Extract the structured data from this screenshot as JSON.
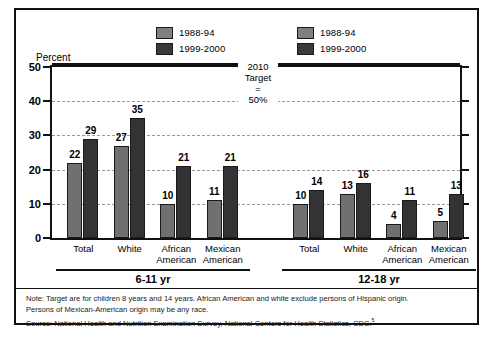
{
  "axis": {
    "ylabel": "Percent",
    "yticks": [
      "0",
      "10",
      "20",
      "30",
      "40",
      "50"
    ]
  },
  "target": {
    "line1": "2010",
    "line2": "Target =",
    "line3": "50%"
  },
  "legends": [
    {
      "name": "legend-left",
      "items": [
        {
          "label": "1988-94",
          "swatch": "light"
        },
        {
          "label": "1999-2000",
          "swatch": "dark"
        }
      ]
    },
    {
      "name": "legend-right",
      "items": [
        {
          "label": "1988-94",
          "swatch": "light"
        },
        {
          "label": "1999-2000",
          "swatch": "dark"
        }
      ]
    }
  ],
  "groups": [
    {
      "label": "6-11 yr",
      "categories": [
        "Total",
        "White",
        "African American",
        "Mexican American"
      ]
    },
    {
      "label": "12-18 yr",
      "categories": [
        "Total",
        "White",
        "African American",
        "Mexican American"
      ]
    }
  ],
  "notes": {
    "line1": "Note: Target are for children 8 years and 14 years. African American and white exclude persons of Hispanic origin.",
    "line2": "Persons of Mexican-American origin may be any race.",
    "line3": "Source: National Health and Nutrition Examination Survey, National Centers for Health Statistics, CDC.",
    "line3_sup": "5"
  },
  "colors": {
    "series_1988_94": "#707070",
    "series_1999_2000": "#333333",
    "axis": "#111111",
    "grid": "#9a9a9a"
  },
  "chart_data": {
    "type": "bar",
    "title": "",
    "xlabel": "",
    "ylabel": "Percent",
    "ylim": [
      0,
      50
    ],
    "yticks": [
      0,
      10,
      20,
      30,
      40,
      50
    ],
    "grid": true,
    "legend_position": "top",
    "annotation": "2010 Target = 50%",
    "target_value": 50,
    "panels": [
      {
        "name": "6-11 yr",
        "categories": [
          "Total",
          "White",
          "African American",
          "Mexican American"
        ],
        "series": [
          {
            "name": "1988-94",
            "values": [
              22,
              27,
              10,
              11
            ]
          },
          {
            "name": "1999-2000",
            "values": [
              29,
              35,
              21,
              21
            ]
          }
        ]
      },
      {
        "name": "12-18 yr",
        "categories": [
          "Total",
          "White",
          "African American",
          "Mexican American"
        ],
        "series": [
          {
            "name": "1988-94",
            "values": [
              10,
              13,
              4,
              5
            ]
          },
          {
            "name": "1999-2000",
            "values": [
              14,
              16,
              11,
              13
            ]
          }
        ]
      }
    ]
  }
}
